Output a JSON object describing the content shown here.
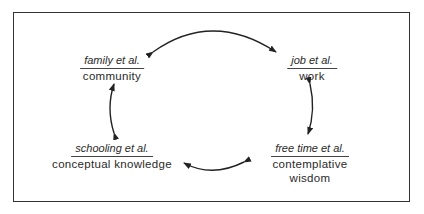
{
  "diagram": {
    "type": "cycle",
    "nodes": [
      {
        "id": "community",
        "top_label": "family et al.",
        "bottom_label": "community"
      },
      {
        "id": "work",
        "top_label": "job et al.",
        "bottom_label": "work"
      },
      {
        "id": "contemplative",
        "top_label": "free time et al.",
        "bottom_label": "contemplative wisdom"
      },
      {
        "id": "conceptual",
        "top_label": "schooling et al.",
        "bottom_label": "conceptual knowledge"
      }
    ],
    "edges": [
      {
        "from": "community",
        "to": "work",
        "bidirectional": true
      },
      {
        "from": "work",
        "to": "contemplative",
        "bidirectional": true
      },
      {
        "from": "contemplative",
        "to": "conceptual",
        "bidirectional": true
      },
      {
        "from": "conceptual",
        "to": "community",
        "bidirectional": true
      }
    ]
  }
}
